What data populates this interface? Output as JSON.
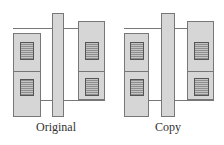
{
  "figures": [
    {
      "caption": "Original",
      "layout": {
        "left_cell": {
          "x": 13,
          "y": 33,
          "w": 28,
          "h": 84
        },
        "gate_bar": {
          "x": 52,
          "y": 13,
          "w": 12,
          "h": 104
        },
        "right_cell": {
          "x": 78,
          "y": 21,
          "w": 27,
          "h": 79
        },
        "top_line_y": 28,
        "bottom_line_y": 100,
        "divider_y": 71
      }
    },
    {
      "caption": "Copy",
      "layout": {
        "left_cell": {
          "x": 12,
          "y": 33,
          "w": 25,
          "h": 84
        },
        "gate_bar": {
          "x": 49,
          "y": 13,
          "w": 14,
          "h": 104
        },
        "right_cell": {
          "x": 75,
          "y": 21,
          "w": 27,
          "h": 79
        },
        "top_line_y": 28,
        "bottom_line_y": 100,
        "divider_y": 71
      }
    }
  ],
  "colors": {
    "outline": "#777777",
    "dot_fill": "#9a9a9a",
    "contact_fill": "#a8a8a8",
    "caption_text": "#333333"
  }
}
